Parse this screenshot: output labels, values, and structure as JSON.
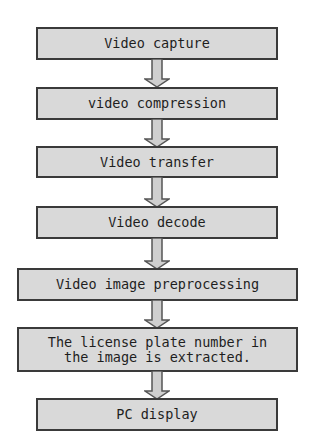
{
  "diagram": {
    "type": "flowchart",
    "direction": "top-to-bottom",
    "colors": {
      "box_fill": "#d9d9d9",
      "box_border": "#3a3a3a",
      "arrow_fill": "#cfcfcf",
      "arrow_stroke": "#555555",
      "text": "#1e1e1e",
      "background": "#ffffff"
    },
    "steps": [
      {
        "label": "Video capture"
      },
      {
        "label": "video compression"
      },
      {
        "label": "Video transfer"
      },
      {
        "label": "Video decode"
      },
      {
        "label": "Video image preprocessing"
      },
      {
        "label": "The license plate number in\nthe image is extracted."
      },
      {
        "label": "PC display"
      }
    ],
    "edges": [
      {
        "from": 0,
        "to": 1
      },
      {
        "from": 1,
        "to": 2
      },
      {
        "from": 2,
        "to": 3
      },
      {
        "from": 3,
        "to": 4
      },
      {
        "from": 4,
        "to": 5
      },
      {
        "from": 5,
        "to": 6
      }
    ]
  }
}
